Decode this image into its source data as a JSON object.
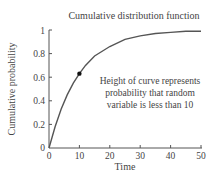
{
  "chart_data": {
    "type": "line",
    "title": "Cumulative distribution function",
    "xlabel": "Time",
    "ylabel": "Cumulative probability",
    "xlim": [
      0,
      50
    ],
    "ylim": [
      0,
      1
    ],
    "x_ticks": [
      "0",
      "10",
      "20",
      "30",
      "40",
      "50"
    ],
    "y_ticks": [
      "0",
      "0.2",
      "0.4",
      "0.6",
      "0.8",
      "1"
    ],
    "grid": false,
    "legend": null,
    "series": [
      {
        "name": "CDF",
        "x": [
          0,
          2,
          4,
          6,
          8,
          10,
          12,
          15,
          20,
          25,
          30,
          35,
          40,
          45,
          50
        ],
        "values": [
          0,
          0.18,
          0.33,
          0.45,
          0.55,
          0.63,
          0.7,
          0.78,
          0.86,
          0.92,
          0.95,
          0.97,
          0.98,
          0.99,
          0.99
        ]
      }
    ],
    "highlight_point": {
      "x": 10,
      "y": 0.63
    },
    "annotation": {
      "lines": [
        "Height of curve represents",
        "probability that random",
        "variable is less than 10"
      ]
    }
  }
}
